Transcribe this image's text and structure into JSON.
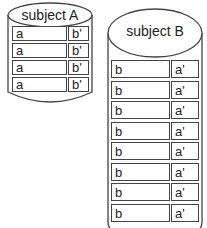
{
  "subject_a": {
    "title": "subject A",
    "rows": [
      {
        "left": "a",
        "right": "b'"
      },
      {
        "left": "a",
        "right": "b'"
      },
      {
        "left": "a",
        "right": "b'"
      },
      {
        "left": "a",
        "right": "b'"
      }
    ]
  },
  "subject_b": {
    "title": "subject B",
    "rows": [
      {
        "left": "b",
        "right": "a'"
      },
      {
        "left": "b",
        "right": "a'"
      },
      {
        "left": "b",
        "right": "a'"
      },
      {
        "left": "b",
        "right": "a'"
      },
      {
        "left": "b",
        "right": "a'"
      },
      {
        "left": "b",
        "right": "a'"
      },
      {
        "left": "b",
        "right": "a'"
      },
      {
        "left": "b",
        "right": "a'"
      }
    ]
  },
  "colors": {
    "stroke": "#444444",
    "background": "#ffffff"
  }
}
